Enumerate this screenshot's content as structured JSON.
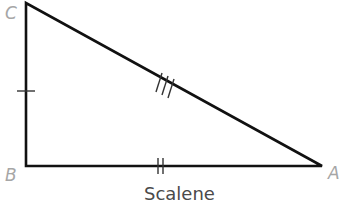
{
  "diagram": {
    "caption": "Scalene",
    "vertices": [
      {
        "label": "C",
        "x": 26,
        "y": 3
      },
      {
        "label": "B",
        "x": 26,
        "y": 166
      },
      {
        "label": "A",
        "x": 322,
        "y": 166
      }
    ],
    "sides": [
      {
        "name": "CB",
        "tick_marks": 1
      },
      {
        "name": "BA",
        "tick_marks": 2
      },
      {
        "name": "CA",
        "tick_marks": 3
      }
    ],
    "colors": {
      "stroke": "#111111",
      "label": "#a6a6a6",
      "caption": "#4a4a4a"
    }
  }
}
